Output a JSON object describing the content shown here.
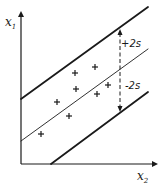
{
  "chart_data": {
    "type": "scatter",
    "title": "",
    "xlabel": "x2",
    "ylabel": "x1",
    "x_axis_label_main": "x",
    "x_axis_label_sub": "2",
    "y_axis_label_main": "x",
    "y_axis_label_sub": "1",
    "grid": false,
    "legend": null,
    "points": [
      {
        "px": 41,
        "py": 134
      },
      {
        "px": 57,
        "py": 102
      },
      {
        "px": 69,
        "py": 116
      },
      {
        "px": 75,
        "py": 73
      },
      {
        "px": 76,
        "py": 89
      },
      {
        "px": 95,
        "py": 67
      },
      {
        "px": 97,
        "py": 94
      },
      {
        "px": 108,
        "py": 85
      }
    ],
    "lines": [
      {
        "name": "upper-limit",
        "style": "thick",
        "x1": 21,
        "y1": 99,
        "x2": 148,
        "y2": 7
      },
      {
        "name": "regression",
        "style": "thin",
        "x1": 21,
        "y1": 141,
        "x2": 148,
        "y2": 49
      },
      {
        "name": "lower-limit",
        "style": "thick",
        "x1": 51,
        "y1": 164,
        "x2": 148,
        "y2": 92
      }
    ],
    "annotations": [
      {
        "text": "+2s",
        "px": 121,
        "py": 47
      },
      {
        "text": "-2s",
        "px": 125,
        "py": 89
      }
    ],
    "band_marker": {
      "x": 120,
      "y_top": 29,
      "y_bottom": 112,
      "style": "dashed-double-arrow"
    },
    "marker": "+",
    "colors": {
      "ink": "#1a1a1a",
      "background": "#ffffff"
    }
  }
}
